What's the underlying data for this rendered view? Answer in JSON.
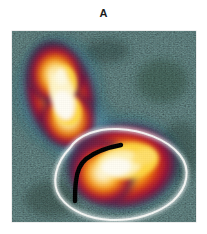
{
  "figure": {
    "panel_label": "A",
    "caption": "",
    "background_color": "#ffffff"
  },
  "image_panel": {
    "name": "false-color-intensity-map",
    "width_px": 184,
    "height_px": 191,
    "background_color": "#05070a",
    "colormap": {
      "name": "thermal-jet",
      "stops": [
        {
          "level": "background",
          "color": "#05070a",
          "label": "lowest"
        },
        {
          "level": "dark-teal",
          "color": "#10262b"
        },
        {
          "level": "blue",
          "color": "#2f7fa8"
        },
        {
          "level": "pale-cyan",
          "color": "#bcd9e4"
        },
        {
          "level": "violet",
          "color": "#8a4a6e"
        },
        {
          "level": "dark-red",
          "color": "#8e1320"
        },
        {
          "level": "red",
          "color": "#cc1f18"
        },
        {
          "level": "orange",
          "color": "#f28a12"
        },
        {
          "level": "yellow",
          "color": "#ffd53d"
        },
        {
          "level": "white",
          "color": "#fffdf2",
          "label": "highest"
        }
      ]
    }
  },
  "features": {
    "blob_upper": {
      "name": "upper-lobe",
      "center_pct": {
        "x": 32,
        "y": 32
      },
      "peak_color": "#fffdf2",
      "halo_color": "#2f7fa8",
      "orientation": "elongated-vertical"
    },
    "blob_lower": {
      "name": "lower-lobe",
      "center_pct": {
        "x": 63,
        "y": 71
      },
      "peak_color": "#fffdf2",
      "contour_color": "#ffffff",
      "orientation": "elongated-horizontal"
    },
    "annotation_curve": {
      "name": "black-marker-curve",
      "color": "#000000",
      "stroke_width_px": 4,
      "shape": "hook"
    },
    "contour_line": {
      "name": "white-isocontour",
      "color": "#ffffff",
      "stroke_width_px": 3,
      "encloses": "lower-lobe"
    }
  }
}
